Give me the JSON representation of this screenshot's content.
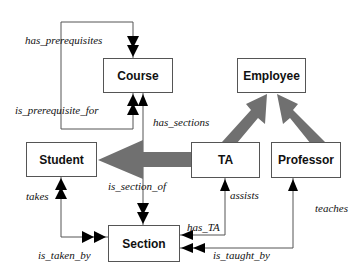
{
  "diagram": {
    "type": "entity-relationship",
    "entities": [
      {
        "id": "course",
        "label": "Course"
      },
      {
        "id": "employee",
        "label": "Employee"
      },
      {
        "id": "student",
        "label": "Student"
      },
      {
        "id": "ta",
        "label": "TA"
      },
      {
        "id": "professor",
        "label": "Professor"
      },
      {
        "id": "section",
        "label": "Section"
      }
    ],
    "relationships": {
      "has_prerequisites": "has_prerequisites",
      "is_prerequisite_for": "is_prerequisite_for",
      "has_sections": "has_sections",
      "is_section_of": "is_section_of",
      "takes": "takes",
      "is_taken_by": "is_taken_by",
      "assists": "assists",
      "has_TA": "has_TA",
      "teaches": "teaches",
      "is_taught_by": "is_taught_by"
    },
    "inheritance": [
      {
        "from": "TA",
        "to": "Employee"
      },
      {
        "from": "Professor",
        "to": "Employee"
      },
      {
        "from": "TA",
        "to": "Student"
      }
    ],
    "colors": {
      "line": "#555555",
      "inheritance_arrow": "#707070",
      "arrowhead": "#000000"
    }
  }
}
